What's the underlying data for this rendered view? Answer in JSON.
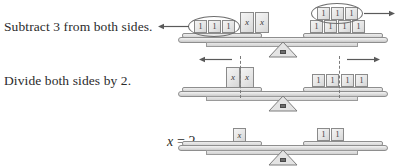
{
  "document": {
    "title": "Balance scale model of solving 2x + 3 = 7"
  },
  "steps": [
    {
      "id": "step-1",
      "label": "Subtract 3 from both sides.",
      "scale": {
        "left_pan": {
          "grouped_units": [
            "1",
            "1",
            "1"
          ],
          "group_marker": "oval",
          "removal_arrow": "left",
          "variable_blocks": [
            "x",
            "x"
          ]
        },
        "right_pan": {
          "grouped_units": [
            "1",
            "1",
            "1"
          ],
          "group_marker": "oval",
          "removal_arrow": "right",
          "base_units": [
            "1",
            "1",
            "1",
            "1"
          ]
        }
      }
    },
    {
      "id": "step-2",
      "label": "Divide both sides by 2.",
      "scale": {
        "left_pan": {
          "variable_blocks": [
            "x",
            "x"
          ],
          "split_line": "dashed",
          "split_arrow": "left"
        },
        "right_pan": {
          "base_units": [
            "1",
            "1",
            "1",
            "1"
          ],
          "split_line": "dashed",
          "split_arrow": "right"
        }
      }
    },
    {
      "id": "step-3",
      "label_math": {
        "variable": "x",
        "operator": "=",
        "value": "2"
      },
      "scale": {
        "left_pan": {
          "variable_blocks": [
            "x"
          ]
        },
        "right_pan": {
          "base_units": [
            "1",
            "1"
          ]
        }
      }
    }
  ],
  "colors": {
    "text": "#2b2b2b",
    "block_fill": "#e8e8e8",
    "block_stroke": "#8a8a8a",
    "beam_stroke": "#8e8e8e",
    "dash_stroke": "#7a7a7a",
    "arrow_stroke": "#5a5a5a",
    "fulcrum_knob": "#6d6d6d",
    "background": "#ffffff"
  }
}
